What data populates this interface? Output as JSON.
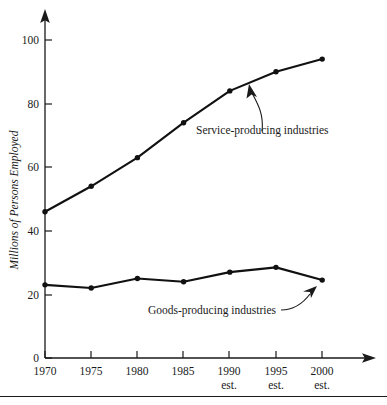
{
  "chart_data": {
    "type": "line",
    "title": "",
    "xlabel": "",
    "ylabel": "Millions of Persons Employed",
    "categories": [
      "1970",
      "1975",
      "1980",
      "1985",
      "1990",
      "1995",
      "2000"
    ],
    "category_sublabels": [
      "",
      "",
      "",
      "",
      "est.",
      "est.",
      "est."
    ],
    "xlim": [
      1970,
      2000
    ],
    "ylim": [
      0,
      105
    ],
    "yticks": [
      0,
      20,
      40,
      60,
      80,
      100
    ],
    "ytick_labels": [
      "0",
      "20",
      "40",
      "60",
      "80",
      "100"
    ],
    "grid": false,
    "legend_position": "inline-annotations",
    "series": [
      {
        "name": "Service-producing industries",
        "values": [
          46,
          54,
          63,
          74,
          84,
          90,
          94
        ],
        "color": "#111111",
        "marker": "circle"
      },
      {
        "name": "Goods-producing industries",
        "values": [
          23,
          22,
          25,
          24,
          27,
          28.5,
          24.5
        ],
        "color": "#111111",
        "marker": "circle"
      }
    ],
    "annotations": [
      {
        "text": "Service-producing industries",
        "target_series": "Service-producing industries",
        "arrow": "curved-up-left"
      },
      {
        "text": "Goods-producing industries",
        "target_series": "Goods-producing industries",
        "arrow": "curved-up-right"
      }
    ]
  },
  "axes": {
    "y_title": "Millions of Persons Employed",
    "y_tick_0": "0",
    "y_tick_20": "20",
    "y_tick_40": "40",
    "y_tick_60": "60",
    "y_tick_80": "80",
    "y_tick_100": "100",
    "x_tick_1": "1970",
    "x_tick_2": "1975",
    "x_tick_3": "1980",
    "x_tick_4": "1985",
    "x_tick_5": "1990",
    "x_tick_6": "1995",
    "x_tick_7": "2000",
    "x_sub_5": "est.",
    "x_sub_6": "est.",
    "x_sub_7": "est."
  },
  "labels": {
    "service": "Service-producing industries",
    "goods": "Goods-producing industries"
  },
  "colors": {
    "ink": "#1a1a1a",
    "line": "#111111",
    "background": "#ffffff"
  }
}
